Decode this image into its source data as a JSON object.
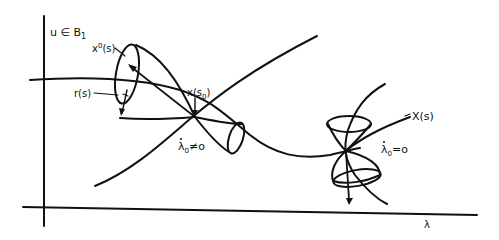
{
  "diagram": {
    "type": "bifurcation-cone-sketch",
    "axes": {
      "vertical_label": "u ∈ B",
      "vertical_label_subscript": "1",
      "horizontal_label": "λ"
    },
    "labels": {
      "x0_s": "x",
      "x0_s_sup": "0",
      "x0_s_arg": "(s)",
      "r_s": "r(s)",
      "x_s0": "x(s",
      "x_s0_sub": "0",
      "x_s0_close": ")",
      "X_s": "X(s)",
      "lambda_dot_neq": "λ",
      "lambda_dot_neq_sub": "0",
      "lambda_dot_neq_rel": "≠o",
      "lambda_dot_eq": "λ",
      "lambda_dot_eq_sub": "0",
      "lambda_dot_eq_rel": "=o"
    },
    "colors": {
      "ink": "#111111",
      "background": "#ffffff"
    }
  }
}
